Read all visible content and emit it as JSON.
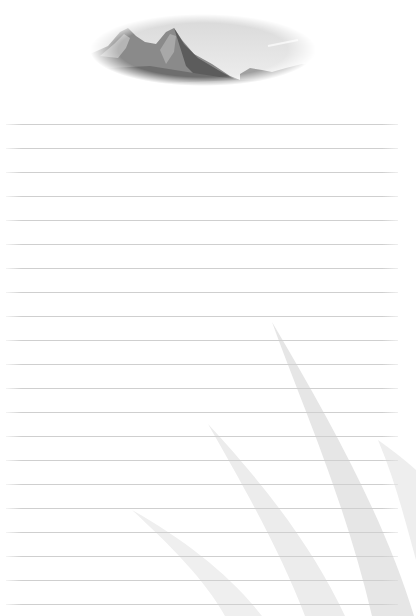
{
  "page": {
    "type": "lined-notepaper",
    "background_color": "#ffffff",
    "line_color": "#cfcfcf",
    "line_count": 21,
    "first_line_y": 124,
    "line_spacing": 24
  },
  "header_image": {
    "subject": "mountain-landscape-icon",
    "shape": "oval",
    "tone": "grayscale"
  },
  "watermark": {
    "subject": "grass-blades-icon",
    "color": "#e8e8e8"
  }
}
